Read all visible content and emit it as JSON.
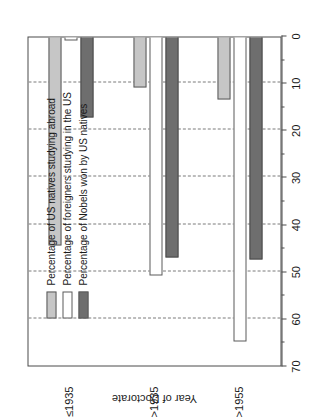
{
  "chart_data": {
    "type": "bar",
    "orientation": "horizontal",
    "title": "",
    "subtitle": "",
    "xlabel": "",
    "ylabel": "Year of Doctorate",
    "categories": [
      "≤1935",
      ">1935",
      ">1955"
    ],
    "series": [
      {
        "name": "Percentage of US natives studying abroad",
        "color": "#c6c6c6",
        "values": [
          44.5,
          11.0,
          13.5
        ]
      },
      {
        "name": "Percentage of foreigners studying in the US",
        "color": "#ffffff",
        "values": [
          1.0,
          51.0,
          65.0
        ]
      },
      {
        "name": "Percentage of Nobels won by US natives",
        "color": "#6e6e6e",
        "values": [
          17.5,
          47.0,
          47.5
        ]
      }
    ],
    "value_axis": {
      "min": 0,
      "max": 70,
      "ticks": [
        0,
        10,
        20,
        30,
        40,
        50,
        60,
        70
      ],
      "tick_labels": [
        "0",
        "10",
        "20",
        "30",
        "40",
        "50",
        "60",
        "70"
      ],
      "minor_ticks": [
        5,
        15,
        25,
        35,
        45,
        55,
        65
      ],
      "grid": true,
      "grid_style": "dashed",
      "direction": "right-to-left"
    },
    "legend": {
      "position": "inside-upper-left",
      "entries": [
        "Percentage of US natives studying abroad",
        "Percentage of foreigners studying in the US",
        "Percentage of Nobels won by US natives"
      ]
    },
    "page_rotation_degrees": -90
  },
  "axes": {
    "category_axis_title": "Year of Doctorate"
  }
}
